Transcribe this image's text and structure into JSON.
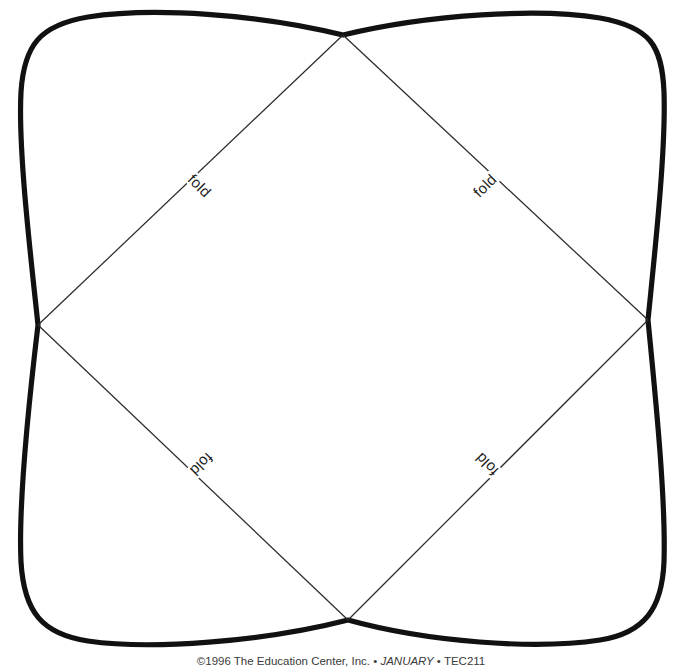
{
  "document": {
    "type": "printable-craft-pattern",
    "title": "Fold pattern template",
    "background_color": "#ffffff",
    "outline_color": "#111111",
    "fold_line_color": "#2b2b2b"
  },
  "shape": {
    "name": "four-lobed-rounded-square",
    "description": "Rounded square with bulged convex sides pinched inward at each edge midpoint",
    "corner_points": [
      {
        "name": "top-vertex",
        "x": 343,
        "y": 35
      },
      {
        "name": "right-vertex",
        "x": 648,
        "y": 320
      },
      {
        "name": "bottom-vertex",
        "x": 348,
        "y": 620
      },
      {
        "name": "left-vertex",
        "x": 38,
        "y": 325
      }
    ]
  },
  "fold_labels": [
    {
      "id": "top-left",
      "text": "fold"
    },
    {
      "id": "top-right",
      "text": "fold"
    },
    {
      "id": "bottom-left",
      "text": "fold"
    },
    {
      "id": "bottom-right",
      "text": "fold"
    }
  ],
  "footer": {
    "copyright": "©1996 The Education Center, Inc.",
    "separator_1": " • ",
    "issue": "JANUARY",
    "separator_2": " • ",
    "code": "TEC211",
    "full_text": "©1996 The Education Center, Inc. • JANUARY • TEC211"
  }
}
